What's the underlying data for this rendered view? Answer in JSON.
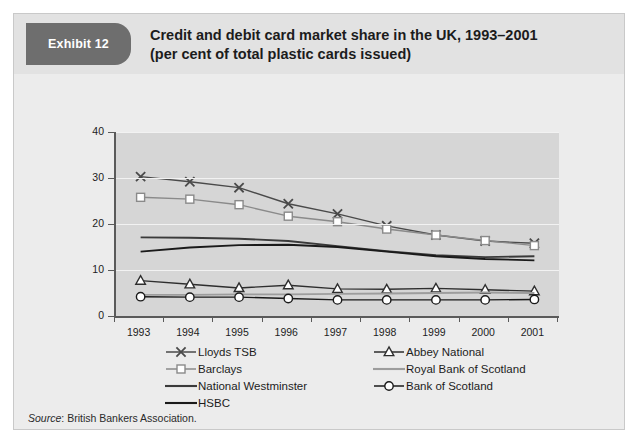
{
  "exhibit": {
    "tag": "Exhibit 12"
  },
  "title": {
    "line1": "Credit and debit card market share in the UK, 1993–2001",
    "line2": "(per cent of total plastic cards issued)"
  },
  "source": {
    "prefix": "Source",
    "text": "British Bankers Association."
  },
  "legend": {
    "col1": [
      {
        "label": "Lloyds TSB",
        "marker": "x-marker",
        "color": "#4a4a4a"
      },
      {
        "label": "Barclays",
        "marker": "square-marker",
        "color": "#8a8a8a"
      },
      {
        "label": "National Westminster",
        "marker": "line-only",
        "color": "#3a3a3a"
      },
      {
        "label": "HSBC",
        "marker": "line-only",
        "color": "#1a1a1a"
      }
    ],
    "col2": [
      {
        "label": "Abbey National",
        "marker": "triangle-marker",
        "color": "#2e2e2e"
      },
      {
        "label": "Royal Bank of Scotland",
        "marker": "line-only",
        "color": "#9d9d9d"
      },
      {
        "label": "Bank of Scotland",
        "marker": "circle-marker",
        "color": "#1a1a1a"
      }
    ]
  },
  "chart_data": {
    "type": "line",
    "title": "Credit and debit card market share in the UK, 1993–2001 (per cent of total plastic cards issued)",
    "xlabel": "",
    "ylabel": "",
    "ylim": [
      0,
      40
    ],
    "ytick_labels": [
      "0",
      "10",
      "20",
      "30",
      "40"
    ],
    "yticks": [
      0,
      10,
      20,
      30,
      40
    ],
    "grid": "horizontal-white-gridlines",
    "legend_position": "below-plot",
    "categories": [
      "1993",
      "1994",
      "1995",
      "1996",
      "1997",
      "1998",
      "1999",
      "2000",
      "2001"
    ],
    "x": [
      1993,
      1994,
      1995,
      1996,
      1997,
      1998,
      1999,
      2000,
      2001
    ],
    "series": [
      {
        "name": "Lloyds TSB",
        "marker": "x",
        "color": "#4a4a4a",
        "values": [
          30.3,
          29.2,
          27.9,
          24.4,
          22.2,
          19.6,
          17.6,
          16.3,
          15.8
        ]
      },
      {
        "name": "Barclays",
        "marker": "square",
        "color": "#8a8a8a",
        "values": [
          25.8,
          25.4,
          24.2,
          21.7,
          20.5,
          18.9,
          17.6,
          16.4,
          15.3
        ]
      },
      {
        "name": "National Westminster",
        "marker": "none",
        "color": "#3a3a3a",
        "values": [
          17.1,
          17.0,
          16.8,
          16.3,
          15.2,
          14.1,
          13.2,
          12.8,
          13.0
        ]
      },
      {
        "name": "HSBC",
        "marker": "none",
        "color": "#1a1a1a",
        "values": [
          14.0,
          14.9,
          15.4,
          15.5,
          15.0,
          14.0,
          13.0,
          12.4,
          12.1
        ]
      },
      {
        "name": "Abbey National",
        "marker": "triangle",
        "color": "#2e2e2e",
        "values": [
          7.7,
          6.9,
          6.1,
          6.7,
          5.9,
          5.8,
          6.0,
          5.7,
          5.4
        ]
      },
      {
        "name": "Royal Bank of Scotland",
        "marker": "none",
        "color": "#9d9d9d",
        "values": [
          4.6,
          4.6,
          4.7,
          4.7,
          4.8,
          4.9,
          5.0,
          5.1,
          5.0
        ]
      },
      {
        "name": "Bank of Scotland",
        "marker": "circle",
        "color": "#1a1a1a",
        "values": [
          4.2,
          4.1,
          4.1,
          3.8,
          3.5,
          3.5,
          3.5,
          3.5,
          3.6
        ]
      }
    ]
  }
}
